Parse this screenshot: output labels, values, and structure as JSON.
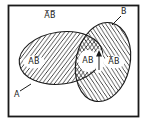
{
  "figure": {
    "type": "venn-diagram",
    "colors": {
      "background": "#ffffff",
      "line": "#1a1a1a",
      "hatch": "#2a2a2a"
    },
    "regions": {
      "outside_label": "A̅B̅",
      "left_only_label": "AB̅",
      "intersection_label": "AB",
      "right_only_label": "A̅B",
      "set_a_label": "A",
      "set_b_label": "B"
    },
    "hatching": {
      "set_a": "diagonal-up",
      "set_b": "diagonal-down",
      "intersection": "cross-hatch"
    },
    "annotations": {
      "up_arrow": "arrow pointing up beside intersection label",
      "set_a_leader": "leader line from label A to left ellipse edge",
      "set_b_leader": "leader line from label B to right ellipse edge"
    }
  }
}
